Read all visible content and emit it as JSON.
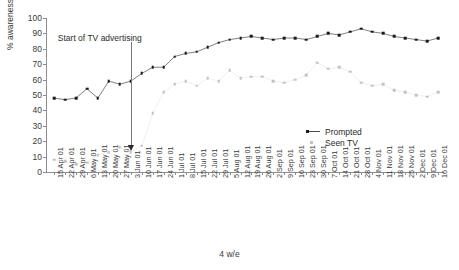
{
  "chart_data": {
    "type": "line",
    "title": "",
    "xlabel": "4 w/e",
    "ylabel": "% awareness",
    "ylim": [
      0,
      100
    ],
    "yticks": [
      0,
      10,
      20,
      30,
      40,
      50,
      60,
      70,
      80,
      90,
      100
    ],
    "grid": false,
    "legend_position": "center-right",
    "categories": [
      "15 Apr 01",
      "22 Apr 01",
      "29 Apr 01",
      "6 May 01",
      "13 May 01",
      "20 May 01",
      "27 May 01",
      "3 Jun 01",
      "10 Jun 01",
      "17 Jun 01",
      "24 Jun 01",
      "1 Jul 01",
      "8 Jul 01",
      "15 Jul 01",
      "22 Jul 01",
      "29 Jul 01",
      "5 Aug 01",
      "12 Aug 01",
      "19 Aug 01",
      "26 Aug 01",
      "2 Sep 01",
      "9 Sep 01",
      "16 Sep 01",
      "23 Sep 01",
      "30 Sep 01",
      "7 Oct 01",
      "14 Oct 01",
      "21 Oct 01",
      "28 Oct 01",
      "4 Nov 01",
      "11 Nov 01",
      "18 Nov 01",
      "25 Nov 01",
      "2 Dec 01",
      "9 Dec 01",
      "16 Dec 01"
    ],
    "series": [
      {
        "name": "Prompted",
        "color": "#1a1a1a",
        "marker": "square",
        "line": true,
        "values": [
          48,
          47,
          48,
          54,
          48,
          59,
          57,
          59,
          64,
          68,
          68,
          75,
          77,
          78,
          81,
          84,
          86,
          87,
          88,
          87,
          86,
          87,
          87,
          86,
          88,
          90,
          89,
          91,
          93,
          91,
          90,
          88,
          87,
          86,
          85,
          87
        ]
      },
      {
        "name": "Seen TV",
        "color": "#c2c2c2",
        "marker": "square",
        "line": false,
        "values": [
          8,
          7,
          5,
          6,
          11,
          13,
          16,
          13,
          17,
          38,
          52,
          57,
          59,
          56,
          61,
          59,
          66,
          61,
          62,
          62,
          59,
          58,
          60,
          63,
          71,
          67,
          68,
          65,
          58,
          56,
          57,
          53,
          52,
          50,
          49,
          52
        ]
      }
    ],
    "annotation": {
      "text": "Start of TV advertising",
      "at_category": "3 Jun 01",
      "arrow": "down"
    }
  },
  "legend": {
    "entries": [
      {
        "label": "Prompted"
      },
      {
        "label": "Seen TV"
      }
    ]
  },
  "axes": {
    "y_title": "% awareness",
    "x_title": "4 w/e"
  }
}
